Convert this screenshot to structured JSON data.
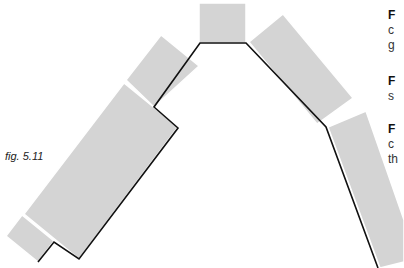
{
  "figure": {
    "caption": "fig. 5.11",
    "fill_color": "#d4d4d4",
    "line_color": "#111111",
    "shapes": [
      {
        "name": "bottom-small-square",
        "points": "6,236 22,215 54,241 38,262"
      },
      {
        "name": "large-lower-left-rect",
        "points": "24,214 124,83 178,127 79,259"
      },
      {
        "name": "upper-left-rect",
        "points": "126,80 161,35 199,66 154,107"
      },
      {
        "name": "top-square",
        "points": "199,3 246,3 246,43 199,43"
      },
      {
        "name": "upper-right-rect",
        "points": "249,42 283,14 353,98 317,124"
      },
      {
        "name": "lower-right-rect",
        "points": "328,127 366,111 404,220 404,262 380,268"
      }
    ],
    "outline": "38,262 54,242 79,259 178,128 154,107 200,43 246,43 326,127 378,268"
  },
  "side_text": [
    {
      "bold": "F",
      "lines": [
        "c",
        "g"
      ]
    },
    {
      "bold": "F",
      "lines": [
        "s"
      ]
    },
    {
      "bold": "F",
      "lines": [
        "c",
        "th"
      ]
    }
  ]
}
